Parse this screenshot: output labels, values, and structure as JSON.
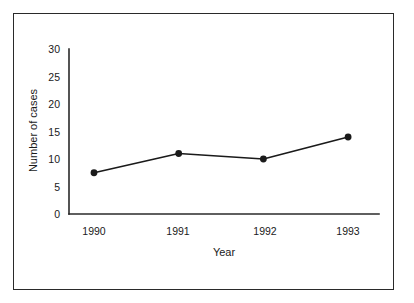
{
  "chart_data": {
    "type": "line",
    "title": "",
    "subtitle": "",
    "xlabel": "Year",
    "ylabel": "Number of cases",
    "categories": [
      "1990",
      "1991",
      "1992",
      "1993"
    ],
    "x": [
      1990,
      1991,
      1992,
      1993
    ],
    "values": [
      7.5,
      11,
      10,
      14
    ],
    "series": [
      {
        "name": "Number of cases",
        "values": [
          7.5,
          11,
          10,
          14
        ]
      }
    ],
    "ylim": [
      0,
      30
    ],
    "yticks": [
      0,
      5,
      10,
      15,
      20,
      25,
      30
    ],
    "ytick_labels": [
      "0",
      "5",
      "10",
      "15",
      "20",
      "25",
      "30"
    ],
    "xtick_labels": [
      "1990",
      "1991",
      "1992",
      "1993"
    ],
    "grid": false,
    "legend": false,
    "legend_position": "none",
    "annotations": [],
    "marker": "filled-circle",
    "line_color": "#1a1a1a",
    "marker_color": "#1a1a1a",
    "background_color": "#ffffff",
    "frame_color": "#2a2a2a"
  }
}
